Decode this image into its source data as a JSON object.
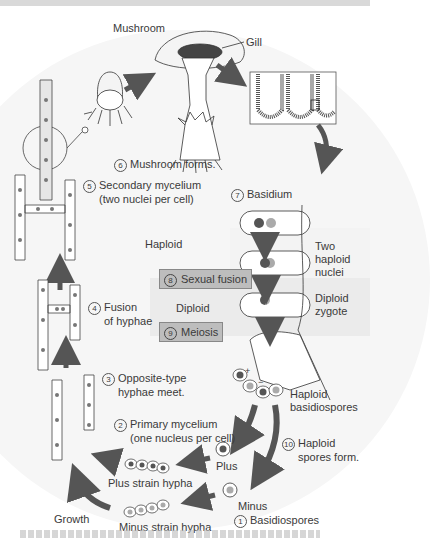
{
  "diagram": {
    "type": "life-cycle",
    "colors": {
      "arrow": "#555555",
      "plus_nucleus": "#555555",
      "minus_nucleus": "#aaaaaa",
      "label_box": "#bdbdbd",
      "diploid_band": "#ebebeb",
      "background_circle": "#f6f6f6"
    },
    "labels": {
      "mushroom": "Mushroom",
      "gill": "Gill",
      "haploid": "Haploid",
      "diploid": "Diploid",
      "two_haploid_nuclei_1": "Two",
      "two_haploid_nuclei_2": "haploid",
      "two_haploid_nuclei_3": "nuclei",
      "diploid_zygote_1": "Diploid",
      "diploid_zygote_2": "zygote",
      "haploid_basidiospores_1": "Haploid",
      "haploid_basidiospores_2": "basidiospores",
      "plus": "Plus",
      "minus": "Minus",
      "plus_strain": "Plus strain hypha",
      "minus_strain": "Minus strain hypha",
      "growth": "Growth",
      "plus_sign": "+",
      "minus_sign": "−"
    },
    "steps": [
      {
        "num": "1",
        "line1": "Basidiospores",
        "line2": ""
      },
      {
        "num": "2",
        "line1": "Primary mycelium",
        "line2": "(one nucleus per cell)"
      },
      {
        "num": "3",
        "line1": "Opposite-type",
        "line2": "hyphae meet."
      },
      {
        "num": "4",
        "line1": "Fusion",
        "line2": "of hyphae"
      },
      {
        "num": "5",
        "line1": "Secondary mycelium",
        "line2": "(two nuclei per cell)"
      },
      {
        "num": "6",
        "line1": "Mushroom forms.",
        "line2": ""
      },
      {
        "num": "7",
        "line1": "Basidium",
        "line2": ""
      },
      {
        "num": "8",
        "line1": "Sexual fusion",
        "line2": ""
      },
      {
        "num": "9",
        "line1": "Meiosis",
        "line2": ""
      },
      {
        "num": "10",
        "line1": "Haploid",
        "line2": "spores form."
      }
    ]
  }
}
